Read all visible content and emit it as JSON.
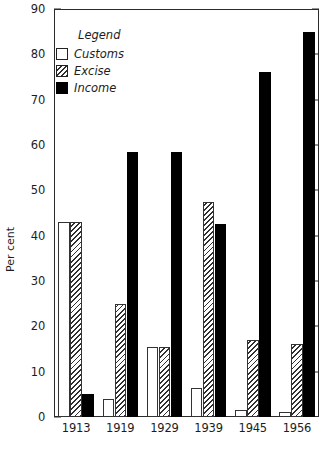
{
  "chart_data": {
    "type": "bar",
    "title": "",
    "subtitle": "",
    "xlabel": "",
    "ylabel": "Per cent",
    "categories": [
      "1913",
      "1919",
      "1929",
      "1939",
      "1945",
      "1956"
    ],
    "series": [
      {
        "name": "Customs",
        "style": "open-white",
        "values": [
          43,
          4,
          15.5,
          6.5,
          1.5,
          1
        ]
      },
      {
        "name": "Excise",
        "style": "diagonal-hatch",
        "values": [
          43,
          25,
          15.5,
          47.5,
          17,
          16
        ]
      },
      {
        "name": "Income",
        "style": "solid-black",
        "values": [
          5,
          58.5,
          58.5,
          42.5,
          76,
          85
        ]
      }
    ],
    "ylim": [
      0,
      90
    ],
    "ytick_step": 10,
    "yticks": [
      0,
      10,
      20,
      30,
      40,
      50,
      60,
      70,
      80,
      90
    ],
    "grid": false,
    "legend_position": "top-left",
    "legend_title": "Legend",
    "frame": "box-with-inward-ticks"
  },
  "colors": {
    "axis": "#2b2b2b",
    "text": "#1d1d1d",
    "income": "#000000",
    "customs": "#ffffff",
    "excise_hatch": "#2f2f2f",
    "background": "#ffffff"
  }
}
